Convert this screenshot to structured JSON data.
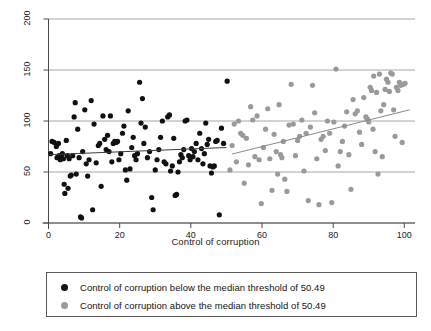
{
  "chart_data": {
    "type": "scatter",
    "title": "",
    "xlabel": "Control of corruption",
    "ylabel": "Gasoline price",
    "xlim": [
      0,
      103
    ],
    "ylim": [
      0,
      200
    ],
    "xticks": [
      0,
      20,
      40,
      60,
      80,
      100
    ],
    "yticks": [
      0,
      50,
      100,
      150,
      200
    ],
    "grid": "horizontal",
    "legend_position": "below-plot",
    "threshold": 50.49,
    "colors": {
      "below_threshold": "#111111",
      "above_threshold": "#9a9a9a",
      "gridline": "#8f8f8f",
      "axis": "#4a4a4a",
      "fit_below": "#3d3d3d",
      "fit_above": "#8a8a8a",
      "legend_border": "#5b5b5b"
    },
    "series": [
      {
        "name": "Control of corruption below the median threshold of 50.49",
        "marker": "circle",
        "color": "#111111",
        "points": [
          [
            0.6,
            68
          ],
          [
            1.0,
            80
          ],
          [
            1.6,
            79
          ],
          [
            2.2,
            75
          ],
          [
            2.4,
            64
          ],
          [
            2.8,
            78
          ],
          [
            3.0,
            66
          ],
          [
            3.3,
            62
          ],
          [
            3.6,
            65
          ],
          [
            3.9,
            68
          ],
          [
            4.2,
            63
          ],
          [
            4.4,
            38
          ],
          [
            4.6,
            29
          ],
          [
            5.0,
            81
          ],
          [
            5.3,
            66
          ],
          [
            5.5,
            34
          ],
          [
            5.8,
            63
          ],
          [
            6.1,
            46
          ],
          [
            6.4,
            47
          ],
          [
            6.8,
            66
          ],
          [
            7.2,
            104
          ],
          [
            7.5,
            118
          ],
          [
            7.8,
            48
          ],
          [
            8.2,
            92
          ],
          [
            8.6,
            64
          ],
          [
            9.0,
            6
          ],
          [
            9.3,
            5
          ],
          [
            9.6,
            70
          ],
          [
            10.2,
            111
          ],
          [
            10.6,
            58
          ],
          [
            11.0,
            46
          ],
          [
            11.4,
            62
          ],
          [
            12.0,
            120
          ],
          [
            12.4,
            13
          ],
          [
            12.8,
            97
          ],
          [
            13.4,
            59
          ],
          [
            14.0,
            76
          ],
          [
            14.4,
            78
          ],
          [
            14.8,
            36
          ],
          [
            15.3,
            105
          ],
          [
            15.8,
            82
          ],
          [
            16.2,
            72
          ],
          [
            16.6,
            86
          ],
          [
            17.0,
            70
          ],
          [
            17.4,
            105
          ],
          [
            17.8,
            60
          ],
          [
            18.2,
            78
          ],
          [
            18.6,
            80
          ],
          [
            19.0,
            79
          ],
          [
            19.4,
            80
          ],
          [
            19.8,
            62
          ],
          [
            20.3,
            68
          ],
          [
            20.8,
            88
          ],
          [
            21.2,
            95
          ],
          [
            21.6,
            52
          ],
          [
            22.0,
            42
          ],
          [
            22.4,
            110
          ],
          [
            22.9,
            53
          ],
          [
            23.4,
            74
          ],
          [
            23.8,
            84
          ],
          [
            24.2,
            66
          ],
          [
            24.6,
            62
          ],
          [
            25.0,
            68
          ],
          [
            25.6,
            138
          ],
          [
            26.0,
            98
          ],
          [
            26.4,
            122
          ],
          [
            26.8,
            78
          ],
          [
            27.2,
            94
          ],
          [
            27.8,
            64
          ],
          [
            28.4,
            70
          ],
          [
            29.0,
            25
          ],
          [
            29.4,
            13
          ],
          [
            30.0,
            52
          ],
          [
            30.5,
            62
          ],
          [
            31.0,
            72
          ],
          [
            31.5,
            84
          ],
          [
            32.0,
            100
          ],
          [
            32.5,
            60
          ],
          [
            33.0,
            58
          ],
          [
            33.5,
            104
          ],
          [
            34.0,
            106
          ],
          [
            34.3,
            51
          ],
          [
            34.8,
            56
          ],
          [
            35.2,
            83
          ],
          [
            35.6,
            27
          ],
          [
            36.0,
            28
          ],
          [
            36.4,
            50
          ],
          [
            36.8,
            60
          ],
          [
            37.2,
            67
          ],
          [
            37.6,
            64
          ],
          [
            38.0,
            72
          ],
          [
            38.4,
            100
          ],
          [
            38.9,
            101
          ],
          [
            39.4,
            66
          ],
          [
            39.8,
            62
          ],
          [
            40.2,
            73
          ],
          [
            40.6,
            65
          ],
          [
            41.0,
            70
          ],
          [
            41.5,
            78
          ],
          [
            42.0,
            62
          ],
          [
            42.5,
            88
          ],
          [
            43.0,
            73
          ],
          [
            43.4,
            58
          ],
          [
            43.8,
            68
          ],
          [
            44.2,
            98
          ],
          [
            44.6,
            77
          ],
          [
            45.0,
            82
          ],
          [
            45.4,
            56
          ],
          [
            45.8,
            49
          ],
          [
            46.2,
            55
          ],
          [
            46.6,
            56
          ],
          [
            47.0,
            80
          ],
          [
            47.4,
            81
          ],
          [
            48.0,
            8
          ],
          [
            48.6,
            93
          ],
          [
            49.2,
            78
          ],
          [
            50.2,
            139
          ]
        ]
      },
      {
        "name": "Control of corruption above the median threshold of 50.49",
        "marker": "circle",
        "color": "#9a9a9a",
        "points": [
          [
            51.0,
            52
          ],
          [
            51.6,
            76
          ],
          [
            52.2,
            97
          ],
          [
            52.8,
            60
          ],
          [
            53.4,
            100
          ],
          [
            54.0,
            88
          ],
          [
            54.6,
            86
          ],
          [
            55.0,
            39
          ],
          [
            55.6,
            83
          ],
          [
            56.2,
            57
          ],
          [
            56.8,
            114
          ],
          [
            57.4,
            101
          ],
          [
            58.0,
            65
          ],
          [
            58.6,
            105
          ],
          [
            59.2,
            62
          ],
          [
            59.8,
            19
          ],
          [
            60.4,
            74
          ],
          [
            61.0,
            92
          ],
          [
            61.6,
            112
          ],
          [
            62.2,
            63
          ],
          [
            62.8,
            32
          ],
          [
            63.4,
            87
          ],
          [
            64.0,
            70
          ],
          [
            64.4,
            48
          ],
          [
            64.8,
            116
          ],
          [
            65.2,
            67
          ],
          [
            65.6,
            64
          ],
          [
            66.0,
            80
          ],
          [
            66.4,
            43
          ],
          [
            67.0,
            31
          ],
          [
            67.6,
            96
          ],
          [
            68.2,
            136
          ],
          [
            68.8,
            97
          ],
          [
            69.4,
            66
          ],
          [
            70.0,
            81
          ],
          [
            70.6,
            85
          ],
          [
            71.2,
            101
          ],
          [
            71.8,
            51
          ],
          [
            72.4,
            88
          ],
          [
            73.0,
            22
          ],
          [
            73.6,
            94
          ],
          [
            74.2,
            135
          ],
          [
            74.8,
            108
          ],
          [
            75.4,
            63
          ],
          [
            76.0,
            18
          ],
          [
            76.6,
            82
          ],
          [
            77.2,
            85
          ],
          [
            77.8,
            71
          ],
          [
            78.4,
            100
          ],
          [
            79.0,
            88
          ],
          [
            79.6,
            20
          ],
          [
            80.2,
            99
          ],
          [
            80.8,
            151
          ],
          [
            81.4,
            56
          ],
          [
            82.0,
            70
          ],
          [
            82.6,
            80
          ],
          [
            83.2,
            95
          ],
          [
            83.8,
            109
          ],
          [
            84.4,
            67
          ],
          [
            85.0,
            33
          ],
          [
            85.6,
            121
          ],
          [
            86.2,
            107
          ],
          [
            86.8,
            110
          ],
          [
            87.4,
            89
          ],
          [
            88.0,
            77
          ],
          [
            88.6,
            123
          ],
          [
            89.2,
            104
          ],
          [
            89.6,
            102
          ],
          [
            90.0,
            99
          ],
          [
            90.4,
            133
          ],
          [
            90.8,
            130
          ],
          [
            91.2,
            92
          ],
          [
            91.4,
            144
          ],
          [
            91.8,
            70
          ],
          [
            92.2,
            128
          ],
          [
            92.6,
            48
          ],
          [
            93.0,
            146
          ],
          [
            93.4,
            110
          ],
          [
            93.8,
            65
          ],
          [
            94.2,
            116
          ],
          [
            94.6,
            131
          ],
          [
            95.0,
            141
          ],
          [
            95.4,
            138
          ],
          [
            95.8,
            129
          ],
          [
            96.2,
            147
          ],
          [
            96.6,
            146
          ],
          [
            97.0,
            111
          ],
          [
            97.4,
            85
          ],
          [
            97.8,
            133
          ],
          [
            98.2,
            130
          ],
          [
            98.6,
            138
          ],
          [
            99.0,
            135
          ],
          [
            99.4,
            79
          ],
          [
            99.8,
            136
          ],
          [
            100.2,
            137
          ]
        ]
      }
    ],
    "fit_lines": [
      {
        "name": "fit-below-threshold",
        "color": "#3d3d3d",
        "x0": 0.0,
        "y0": 67.0,
        "x1": 50.0,
        "y1": 74.0
      },
      {
        "name": "fit-above-threshold",
        "color": "#8a8a8a",
        "x0": 51.5,
        "y0": 67.5,
        "x1": 101.5,
        "y1": 111.0
      }
    ]
  },
  "legend": {
    "items": [
      {
        "marker_color": "#111111",
        "label": "Control of corruption below the median threshold of 50.49"
      },
      {
        "marker_color": "#9a9a9a",
        "label": "Control of corruption above the median threshold of 50.49"
      }
    ]
  },
  "axes": {
    "x_title": "Control of corruption",
    "y_title": "Gasoline price",
    "x_tick_labels": [
      "0",
      "20",
      "40",
      "60",
      "80",
      "100"
    ],
    "y_tick_labels": [
      "0",
      "50",
      "100",
      "150",
      "200"
    ]
  }
}
